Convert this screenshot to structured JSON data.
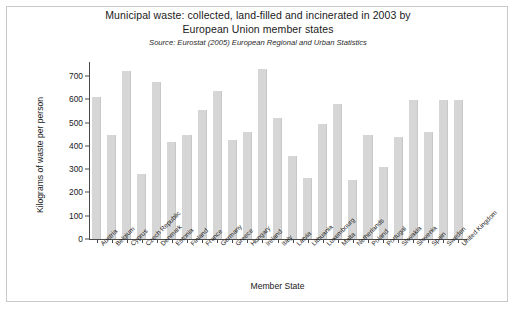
{
  "chart_data": {
    "type": "bar",
    "title_lines": [
      "Municipal waste: collected, land-filled and incinerated in 2003 by",
      "European Union member states"
    ],
    "subtitle_prefix": "Source: Eurostat (2005) ",
    "subtitle_publication": "European Regional and Urban Statistics",
    "xlabel": "Member State",
    "ylabel": "Kilograms of waste per person",
    "ylim": [
      0,
      760
    ],
    "yticks": [
      0,
      100,
      200,
      300,
      400,
      500,
      600,
      700
    ],
    "grid": false,
    "legend": "none",
    "bar_color": "#d6d6d6",
    "categories": [
      "Austria",
      "Belgium",
      "Cyprus",
      "Czech Republic",
      "Denmark",
      "Estonia",
      "Finland",
      "France",
      "Germany",
      "Greece",
      "Hungary",
      "Ireland",
      "Italy",
      "Latvia",
      "Lithuania",
      "Luxembourg",
      "Malta",
      "Netherlands",
      "Poland",
      "Portugal",
      "Slovakia",
      "Slovenia",
      "Spain",
      "Sweden",
      "United Kingdom"
    ],
    "values": [
      610,
      445,
      722,
      280,
      675,
      415,
      445,
      553,
      635,
      425,
      458,
      730,
      518,
      358,
      260,
      495,
      580,
      255,
      445,
      310,
      440,
      598,
      460,
      598,
      598
    ]
  }
}
